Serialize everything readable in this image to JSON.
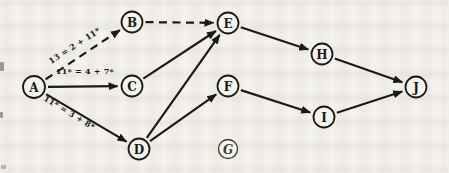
{
  "figure": {
    "paper_color": "#f5f3ee",
    "ink_color": "#1c1a18",
    "light_ink_color": "#3c3a36",
    "width": 449,
    "height": 173
  },
  "diagram": {
    "type": "directed-graph",
    "nodes": [
      {
        "id": "A",
        "label": "A",
        "x": 34,
        "y": 87,
        "r": 11
      },
      {
        "id": "B",
        "label": "B",
        "x": 132,
        "y": 22,
        "r": 10.5
      },
      {
        "id": "C",
        "label": "C",
        "x": 132,
        "y": 86,
        "r": 10.5
      },
      {
        "id": "D",
        "label": "D",
        "x": 139,
        "y": 149,
        "r": 10.5
      },
      {
        "id": "E",
        "label": "E",
        "x": 228,
        "y": 23,
        "r": 10.5
      },
      {
        "id": "F",
        "label": "F",
        "x": 228,
        "y": 86,
        "r": 10.5
      },
      {
        "id": "G",
        "label": "G",
        "x": 228,
        "y": 149,
        "r": 9.5,
        "variant": "italic-light"
      },
      {
        "id": "H",
        "label": "H",
        "x": 322,
        "y": 54,
        "r": 10.5
      },
      {
        "id": "I",
        "label": "I",
        "x": 324,
        "y": 117,
        "r": 10.5
      },
      {
        "id": "J",
        "label": "J",
        "x": 416,
        "y": 87,
        "r": 10.5
      }
    ],
    "edges": [
      {
        "from": "A",
        "to": "B",
        "style": "dashed",
        "label": "13 = 2 + 11*",
        "label_x": 76,
        "label_y": 48,
        "label_rotation": -33
      },
      {
        "from": "A",
        "to": "C",
        "style": "solid",
        "label": "11* = 4 + 7*",
        "label_x": 85,
        "label_y": 74,
        "label_rotation": 0
      },
      {
        "from": "A",
        "to": "D",
        "style": "solid",
        "label": "11* = 3 + 8*",
        "label_x": 68,
        "label_y": 115,
        "label_rotation": 31
      },
      {
        "from": "B",
        "to": "E",
        "style": "dashed",
        "label": ""
      },
      {
        "from": "C",
        "to": "E",
        "style": "solid",
        "label": ""
      },
      {
        "from": "D",
        "to": "E",
        "style": "solid",
        "label": ""
      },
      {
        "from": "D",
        "to": "F",
        "style": "solid",
        "label": ""
      },
      {
        "from": "E",
        "to": "H",
        "style": "solid",
        "label": ""
      },
      {
        "from": "F",
        "to": "I",
        "style": "solid",
        "label": ""
      },
      {
        "from": "H",
        "to": "J",
        "style": "solid",
        "label": ""
      },
      {
        "from": "I",
        "to": "J",
        "style": "solid",
        "label": ""
      }
    ]
  }
}
